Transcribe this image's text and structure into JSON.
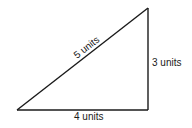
{
  "diagram": {
    "type": "right-triangle",
    "line_color": "#1a1a1a",
    "vertices": {
      "bottom_left": [
        17,
        110
      ],
      "bottom_right": [
        148,
        110
      ],
      "top_right": [
        148,
        8
      ]
    },
    "labels": {
      "hypotenuse": "5 units",
      "vertical_side": "3 units",
      "base": "4 units"
    }
  }
}
